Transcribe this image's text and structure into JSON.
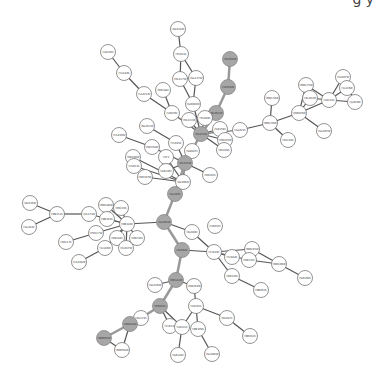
{
  "header_fragment": "g y",
  "colors": {
    "highlight": "#a6a6a6",
    "node": "#ffffff",
    "edge": "#555555",
    "highlight_edge": "#999999"
  },
  "nodes": [
    {
      "id": "n1",
      "label": "YAL024W",
      "x": 178,
      "y": 29,
      "hl": false
    },
    {
      "id": "n2",
      "label": "YPL031C",
      "x": 181,
      "y": 54,
      "hl": false
    },
    {
      "id": "n3",
      "label": "YOL117W",
      "x": 180,
      "y": 79,
      "hl": false
    },
    {
      "id": "n4",
      "label": "YGL137W",
      "x": 196,
      "y": 78,
      "hl": false
    },
    {
      "id": "n5",
      "label": "YGR040W",
      "x": 193,
      "y": 104,
      "hl": false
    },
    {
      "id": "n6",
      "label": "YOL050W",
      "x": 230,
      "y": 59,
      "hl": true
    },
    {
      "id": "n7",
      "label": "YLR026W",
      "x": 228,
      "y": 87,
      "hl": true
    },
    {
      "id": "n8",
      "label": "YNL051W",
      "x": 216,
      "y": 113,
      "hl": true
    },
    {
      "id": "n9",
      "label": "YLR310C",
      "x": 108,
      "y": 52,
      "hl": false
    },
    {
      "id": "n10",
      "label": "YHL180C",
      "x": 124,
      "y": 73,
      "hl": false
    },
    {
      "id": "n11",
      "label": "YLL021W",
      "x": 144,
      "y": 94,
      "hl": false
    },
    {
      "id": "n12",
      "label": "YDR188C",
      "x": 163,
      "y": 90,
      "hl": false
    },
    {
      "id": "n13",
      "label": "YLR079C",
      "x": 172,
      "y": 113,
      "hl": false
    },
    {
      "id": "n14",
      "label": "YOL133W",
      "x": 189,
      "y": 120,
      "hl": false
    },
    {
      "id": "n15",
      "label": "YPL049C",
      "x": 205,
      "y": 118,
      "hl": false
    },
    {
      "id": "n16",
      "label": "YAL023W",
      "x": 201,
      "y": 134,
      "hl": true
    },
    {
      "id": "n17",
      "label": "YGR159C",
      "x": 220,
      "y": 129,
      "hl": false
    },
    {
      "id": "n18",
      "label": "YDR226W",
      "x": 225,
      "y": 140,
      "hl": false
    },
    {
      "id": "n19",
      "label": "YBL010C",
      "x": 224,
      "y": 150,
      "hl": false
    },
    {
      "id": "n20",
      "label": "YGL022C",
      "x": 240,
      "y": 130,
      "hl": false
    },
    {
      "id": "n21",
      "label": "YMR178W",
      "x": 272,
      "y": 98,
      "hl": false
    },
    {
      "id": "n22",
      "label": "YMR179W",
      "x": 270,
      "y": 123,
      "hl": false
    },
    {
      "id": "n23",
      "label": "YDL140C",
      "x": 288,
      "y": 140,
      "hl": false
    },
    {
      "id": "n24",
      "label": "YDR039W",
      "x": 299,
      "y": 113,
      "hl": false
    },
    {
      "id": "n25",
      "label": "YMR173W",
      "x": 306,
      "y": 85,
      "hl": false
    },
    {
      "id": "n26",
      "label": "YBL102W",
      "x": 310,
      "y": 98,
      "hl": false
    },
    {
      "id": "n27",
      "label": "YLR121C",
      "x": 329,
      "y": 100,
      "hl": false
    },
    {
      "id": "n28",
      "label": "YEL007W",
      "x": 343,
      "y": 77,
      "hl": false
    },
    {
      "id": "n29",
      "label": "YJL129W",
      "x": 347,
      "y": 88,
      "hl": false
    },
    {
      "id": "n30",
      "label": "YJL020W",
      "x": 355,
      "y": 102,
      "hl": false
    },
    {
      "id": "n31",
      "label": "YGL002W",
      "x": 324,
      "y": 131,
      "hl": false
    },
    {
      "id": "n32",
      "label": "YNL022W",
      "x": 147,
      "y": 126,
      "hl": false
    },
    {
      "id": "n33",
      "label": "YHL039W",
      "x": 119,
      "y": 135,
      "hl": false
    },
    {
      "id": "n34",
      "label": "YOR158W",
      "x": 152,
      "y": 147,
      "hl": false
    },
    {
      "id": "n35",
      "label": "YFL045C",
      "x": 176,
      "y": 143,
      "hl": false
    },
    {
      "id": "n36",
      "label": "YGR087C",
      "x": 192,
      "y": 151,
      "hl": false
    },
    {
      "id": "n37",
      "label": "YDL022W",
      "x": 185,
      "y": 163,
      "hl": true
    },
    {
      "id": "n38",
      "label": "YBR160W",
      "x": 133,
      "y": 157,
      "hl": false
    },
    {
      "id": "n39",
      "label": "YHL023C",
      "x": 134,
      "y": 166,
      "hl": false
    },
    {
      "id": "n40",
      "label": "YOR197W",
      "x": 145,
      "y": 177,
      "hl": false
    },
    {
      "id": "n41",
      "label": "YEF3",
      "x": 166,
      "y": 157,
      "hl": false
    },
    {
      "id": "n42",
      "label": "YGR246C",
      "x": 166,
      "y": 171,
      "hl": false
    },
    {
      "id": "n43",
      "label": "YAL006W",
      "x": 183,
      "y": 182,
      "hl": false
    },
    {
      "id": "n44",
      "label": "YOR102C",
      "x": 210,
      "y": 175,
      "hl": false
    },
    {
      "id": "n45",
      "label": "YGL195C",
      "x": 175,
      "y": 194,
      "hl": true
    },
    {
      "id": "n46",
      "label": "YAL026W",
      "x": 30,
      "y": 203,
      "hl": false
    },
    {
      "id": "n47",
      "label": "YMR111C",
      "x": 57,
      "y": 214,
      "hl": false
    },
    {
      "id": "n48",
      "label": "YGL161C",
      "x": 29,
      "y": 227,
      "hl": false
    },
    {
      "id": "n49",
      "label": "YKL173W",
      "x": 89,
      "y": 214,
      "hl": false
    },
    {
      "id": "n50",
      "label": "YMR186W",
      "x": 106,
      "y": 205,
      "hl": false
    },
    {
      "id": "n51",
      "label": "YPR120C",
      "x": 121,
      "y": 208,
      "hl": false
    },
    {
      "id": "n52",
      "label": "YMR163C",
      "x": 107,
      "y": 219,
      "hl": false
    },
    {
      "id": "n53",
      "label": "YMR186C",
      "x": 127,
      "y": 224,
      "hl": false
    },
    {
      "id": "n54",
      "label": "YPR117W",
      "x": 96,
      "y": 233,
      "hl": false
    },
    {
      "id": "n55",
      "label": "YER117C",
      "x": 66,
      "y": 242,
      "hl": false
    },
    {
      "id": "n56",
      "label": "YDR184C",
      "x": 117,
      "y": 238,
      "hl": false
    },
    {
      "id": "n57",
      "label": "YIL140W",
      "x": 105,
      "y": 248,
      "hl": false
    },
    {
      "id": "n58",
      "label": "YEL017W",
      "x": 126,
      "y": 248,
      "hl": false
    },
    {
      "id": "n59",
      "label": "YOR230C",
      "x": 137,
      "y": 238,
      "hl": false
    },
    {
      "id": "n60",
      "label": "YHL038W",
      "x": 79,
      "y": 262,
      "hl": false
    },
    {
      "id": "n61",
      "label": "YGL092W",
      "x": 164,
      "y": 222,
      "hl": true
    },
    {
      "id": "n62",
      "label": "YAL040C",
      "x": 192,
      "y": 232,
      "hl": false
    },
    {
      "id": "n63",
      "label": "YHR052C",
      "x": 215,
      "y": 226,
      "hl": false
    },
    {
      "id": "n64",
      "label": "YDL088C",
      "x": 182,
      "y": 250,
      "hl": true
    },
    {
      "id": "n65",
      "label": "YFL039C",
      "x": 214,
      "y": 252,
      "hl": false
    },
    {
      "id": "n66",
      "label": "YFL084C",
      "x": 232,
      "y": 257,
      "hl": false
    },
    {
      "id": "n67",
      "label": "YMR163W",
      "x": 252,
      "y": 249,
      "hl": false
    },
    {
      "id": "n68",
      "label": "YOR232C",
      "x": 249,
      "y": 260,
      "hl": false
    },
    {
      "id": "n69",
      "label": "YMR109W",
      "x": 279,
      "y": 264,
      "hl": false
    },
    {
      "id": "n70",
      "label": "YGR109C",
      "x": 305,
      "y": 278,
      "hl": false
    },
    {
      "id": "n71",
      "label": "YDR329C",
      "x": 232,
      "y": 276,
      "hl": false
    },
    {
      "id": "n72",
      "label": "YMR052C",
      "x": 261,
      "y": 290,
      "hl": false
    },
    {
      "id": "n73",
      "label": "YOR181W",
      "x": 176,
      "y": 280,
      "hl": true
    },
    {
      "id": "n74",
      "label": "YGL039W",
      "x": 155,
      "y": 285,
      "hl": false
    },
    {
      "id": "n75",
      "label": "YDR264W",
      "x": 194,
      "y": 286,
      "hl": false
    },
    {
      "id": "n76",
      "label": "YBR026C",
      "x": 160,
      "y": 306,
      "hl": true
    },
    {
      "id": "n77",
      "label": "YLR362C",
      "x": 196,
      "y": 306,
      "hl": false
    },
    {
      "id": "n78",
      "label": "YDL231C",
      "x": 141,
      "y": 318,
      "hl": false
    },
    {
      "id": "n79",
      "label": "YOL012C",
      "x": 227,
      "y": 318,
      "hl": false
    },
    {
      "id": "n80",
      "label": "YDR188W",
      "x": 130,
      "y": 324,
      "hl": true
    },
    {
      "id": "n81",
      "label": "YFL013C",
      "x": 170,
      "y": 326,
      "hl": false
    },
    {
      "id": "n82",
      "label": "YLR421C",
      "x": 182,
      "y": 327,
      "hl": false
    },
    {
      "id": "n83",
      "label": "YMR109C",
      "x": 198,
      "y": 329,
      "hl": false
    },
    {
      "id": "n84",
      "label": "YMR031C",
      "x": 250,
      "y": 336,
      "hl": false
    },
    {
      "id": "n85",
      "label": "YMR092W",
      "x": 104,
      "y": 338,
      "hl": true
    },
    {
      "id": "n86",
      "label": "YMR058W",
      "x": 122,
      "y": 350,
      "hl": false
    },
    {
      "id": "n87",
      "label": "YGR144C",
      "x": 178,
      "y": 355,
      "hl": false
    },
    {
      "id": "n88",
      "label": "YGL066W",
      "x": 212,
      "y": 354,
      "hl": false
    }
  ],
  "edges": [
    [
      "n1",
      "n2",
      0
    ],
    [
      "n2",
      "n3",
      0
    ],
    [
      "n2",
      "n4",
      0
    ],
    [
      "n3",
      "n5",
      0
    ],
    [
      "n4",
      "n5",
      0
    ],
    [
      "n3",
      "n4",
      0
    ],
    [
      "n6",
      "n7",
      1
    ],
    [
      "n7",
      "n8",
      1
    ],
    [
      "n8",
      "n16",
      1
    ],
    [
      "n9",
      "n10",
      0
    ],
    [
      "n10",
      "n11",
      0
    ],
    [
      "n11",
      "n13",
      0
    ],
    [
      "n12",
      "n13",
      0
    ],
    [
      "n13",
      "n16",
      0
    ],
    [
      "n5",
      "n16",
      0
    ],
    [
      "n14",
      "n16",
      0
    ],
    [
      "n15",
      "n16",
      0
    ],
    [
      "n16",
      "n17",
      0
    ],
    [
      "n16",
      "n18",
      0
    ],
    [
      "n16",
      "n19",
      0
    ],
    [
      "n16",
      "n20",
      0
    ],
    [
      "n20",
      "n22",
      0
    ],
    [
      "n21",
      "n22",
      0
    ],
    [
      "n22",
      "n23",
      0
    ],
    [
      "n22",
      "n24",
      0
    ],
    [
      "n24",
      "n25",
      0
    ],
    [
      "n24",
      "n26",
      0
    ],
    [
      "n24",
      "n27",
      0
    ],
    [
      "n25",
      "n27",
      0
    ],
    [
      "n26",
      "n27",
      0
    ],
    [
      "n27",
      "n28",
      0
    ],
    [
      "n27",
      "n29",
      0
    ],
    [
      "n27",
      "n30",
      0
    ],
    [
      "n28",
      "n30",
      0
    ],
    [
      "n24",
      "n31",
      0
    ],
    [
      "n16",
      "n37",
      1
    ],
    [
      "n32",
      "n35",
      0
    ],
    [
      "n33",
      "n34",
      0
    ],
    [
      "n34",
      "n37",
      0
    ],
    [
      "n35",
      "n37",
      0
    ],
    [
      "n36",
      "n37",
      0
    ],
    [
      "n38",
      "n43",
      0
    ],
    [
      "n39",
      "n43",
      0
    ],
    [
      "n40",
      "n43",
      0
    ],
    [
      "n41",
      "n43",
      0
    ],
    [
      "n42",
      "n37",
      0
    ],
    [
      "n37",
      "n43",
      0
    ],
    [
      "n37",
      "n44",
      0
    ],
    [
      "n37",
      "n45",
      1
    ],
    [
      "n45",
      "n61",
      1
    ],
    [
      "n46",
      "n47",
      0
    ],
    [
      "n47",
      "n48",
      0
    ],
    [
      "n47",
      "n49",
      0
    ],
    [
      "n49",
      "n53",
      0
    ],
    [
      "n50",
      "n53",
      0
    ],
    [
      "n51",
      "n53",
      0
    ],
    [
      "n52",
      "n53",
      0
    ],
    [
      "n53",
      "n61",
      0
    ],
    [
      "n54",
      "n53",
      0
    ],
    [
      "n55",
      "n54",
      0
    ],
    [
      "n53",
      "n56",
      0
    ],
    [
      "n53",
      "n57",
      0
    ],
    [
      "n53",
      "n58",
      0
    ],
    [
      "n53",
      "n59",
      0
    ],
    [
      "n57",
      "n60",
      0
    ],
    [
      "n61",
      "n62",
      0
    ],
    [
      "n62",
      "n65",
      0
    ],
    [
      "n61",
      "n64",
      1
    ],
    [
      "n64",
      "n65",
      0
    ],
    [
      "n65",
      "n66",
      0
    ],
    [
      "n65",
      "n67",
      0
    ],
    [
      "n65",
      "n68",
      0
    ],
    [
      "n67",
      "n69",
      0
    ],
    [
      "n68",
      "n69",
      0
    ],
    [
      "n69",
      "n70",
      0
    ],
    [
      "n65",
      "n71",
      0
    ],
    [
      "n71",
      "n72",
      0
    ],
    [
      "n64",
      "n73",
      1
    ],
    [
      "n73",
      "n74",
      0
    ],
    [
      "n73",
      "n75",
      0
    ],
    [
      "n73",
      "n76",
      1
    ],
    [
      "n75",
      "n77",
      0
    ],
    [
      "n76",
      "n78",
      1
    ],
    [
      "n78",
      "n80",
      1
    ],
    [
      "n80",
      "n85",
      1
    ],
    [
      "n85",
      "n86",
      0
    ],
    [
      "n80",
      "n86",
      0
    ],
    [
      "n76",
      "n81",
      0
    ],
    [
      "n76",
      "n82",
      0
    ],
    [
      "n77",
      "n82",
      0
    ],
    [
      "n77",
      "n83",
      0
    ],
    [
      "n77",
      "n79",
      0
    ],
    [
      "n79",
      "n84",
      0
    ],
    [
      "n82",
      "n87",
      0
    ],
    [
      "n83",
      "n88",
      0
    ]
  ]
}
